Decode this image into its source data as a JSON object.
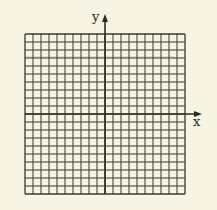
{
  "diagram": {
    "type": "coordinate-grid",
    "grid": {
      "columns": 20,
      "rows": 20,
      "left": 25,
      "top": 34,
      "cell": 8,
      "line_color": "#3a3a33",
      "background": "#f7f4e4"
    },
    "axes": {
      "x_label": "x",
      "y_label": "y",
      "y_axis_column": 10,
      "x_axis_row": 10,
      "arrow_color": "#2b2a25"
    },
    "artifacts": {
      "faint_red_line_y": 57,
      "faint_red_color": "#d08a86"
    }
  }
}
